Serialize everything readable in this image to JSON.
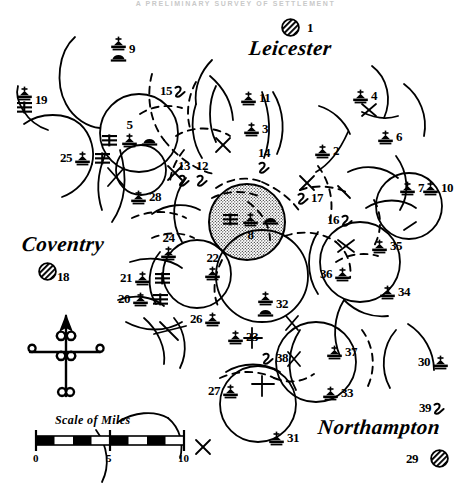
{
  "header": {
    "running_head": "A PRELIMINARY SURVEY OF SETTLEMENT"
  },
  "map": {
    "title": "Archaeological settlement distribution map",
    "scale_bar": {
      "caption": "Scale of Miles",
      "ticks": [
        "0",
        "5",
        "10"
      ],
      "units": "miles",
      "max": 10
    },
    "compass": {
      "name": "north-arrow",
      "direction": "N"
    },
    "legend_symbols": {
      "church": "church-symbol",
      "dome": "dome-symbol",
      "grid": "field-system-symbol",
      "hook": "moated-site-symbol",
      "town": "hatched-town-circle",
      "stipple": "stippled-territory"
    },
    "cities": [
      {
        "name": "Leicester",
        "number": "1",
        "x": 249,
        "y": 38,
        "marker_x": 281,
        "marker_y": 18,
        "num_x": 307,
        "num_y": 21
      },
      {
        "name": "Coventry",
        "number": "18",
        "x": 22,
        "y": 234,
        "marker_x": 38,
        "marker_y": 262,
        "num_x": 57,
        "num_y": 270
      },
      {
        "name": "Northampton",
        "number": "29",
        "x": 318,
        "y": 417,
        "marker_x": 430,
        "marker_y": 449,
        "num_x": 406,
        "num_y": 452
      }
    ],
    "sites": [
      {
        "id": "2",
        "number": "2",
        "symbols": [
          "church"
        ],
        "order": "sym-num",
        "x": 314,
        "y": 143
      },
      {
        "id": "3",
        "number": "3",
        "symbols": [
          "church"
        ],
        "order": "sym-num",
        "x": 243,
        "y": 121
      },
      {
        "id": "4",
        "number": "4",
        "symbols": [
          "church"
        ],
        "order": "sym-num",
        "x": 352,
        "y": 88
      },
      {
        "id": "5",
        "number": "5",
        "symbols": [
          "grid",
          "church",
          "dome"
        ],
        "order": "num-above",
        "x": 101,
        "y": 117
      },
      {
        "id": "6",
        "number": "6",
        "symbols": [
          "church"
        ],
        "order": "sym-num",
        "x": 377,
        "y": 129
      },
      {
        "id": "7",
        "number": "7",
        "symbols": [
          "church"
        ],
        "order": "sym-num",
        "x": 399,
        "y": 180
      },
      {
        "id": "8",
        "number": "8",
        "symbols": [
          "grid",
          "church",
          "dome"
        ],
        "order": "num-below",
        "x": 222,
        "y": 212
      },
      {
        "id": "9",
        "number": "9",
        "symbols": [
          "church",
          "dome"
        ],
        "order": "stack-num",
        "x": 110,
        "y": 36
      },
      {
        "id": "10",
        "number": "10",
        "symbols": [
          "church"
        ],
        "order": "sym-num",
        "x": 422,
        "y": 180
      },
      {
        "id": "11",
        "number": "11",
        "symbols": [
          "church"
        ],
        "order": "sym-num",
        "x": 240,
        "y": 90
      },
      {
        "id": "12",
        "number": "12",
        "symbols": [
          "hook"
        ],
        "order": "num-above",
        "x": 196,
        "y": 158
      },
      {
        "id": "13",
        "number": "13",
        "symbols": [
          "hook"
        ],
        "order": "num-above",
        "x": 178,
        "y": 158
      },
      {
        "id": "14",
        "number": "14",
        "symbols": [
          "hook"
        ],
        "order": "num-above",
        "x": 258,
        "y": 145
      },
      {
        "id": "15",
        "number": "15",
        "symbols": [
          "hook"
        ],
        "order": "num-sym",
        "x": 160,
        "y": 83
      },
      {
        "id": "16",
        "number": "16",
        "symbols": [
          "hook"
        ],
        "order": "num-sym",
        "x": 327,
        "y": 212
      },
      {
        "id": "17",
        "number": "17",
        "symbols": [
          "hook"
        ],
        "order": "sym-num",
        "x": 297,
        "y": 190
      },
      {
        "id": "19",
        "number": "19",
        "symbols": [
          "church",
          "grid"
        ],
        "order": "stack-num",
        "x": 16,
        "y": 86
      },
      {
        "id": "20",
        "number": "20",
        "symbols": [
          "church",
          "grid"
        ],
        "order": "num-sym",
        "x": 118,
        "y": 291
      },
      {
        "id": "21",
        "number": "21",
        "symbols": [
          "church",
          "grid"
        ],
        "order": "num-sym",
        "x": 120,
        "y": 270
      },
      {
        "id": "22",
        "number": "22",
        "symbols": [
          "church"
        ],
        "order": "num-above",
        "x": 204,
        "y": 250
      },
      {
        "id": "23",
        "number": "23",
        "symbols": [
          "church"
        ],
        "order": "sym-num",
        "x": 227,
        "y": 329
      },
      {
        "id": "24",
        "number": "24",
        "symbols": [
          "church"
        ],
        "order": "num-above",
        "x": 160,
        "y": 230
      },
      {
        "id": "25",
        "number": "25",
        "symbols": [
          "church",
          "grid"
        ],
        "order": "num-sym",
        "x": 60,
        "y": 150
      },
      {
        "id": "26",
        "number": "26",
        "symbols": [
          "church"
        ],
        "order": "num-sym",
        "x": 190,
        "y": 311
      },
      {
        "id": "27",
        "number": "27",
        "symbols": [
          "church"
        ],
        "order": "num-sym",
        "x": 208,
        "y": 383
      },
      {
        "id": "28",
        "number": "28",
        "symbols": [
          "church"
        ],
        "order": "sym-num",
        "x": 130,
        "y": 189
      },
      {
        "id": "30",
        "number": "30",
        "symbols": [
          "church"
        ],
        "order": "num-sym",
        "x": 418,
        "y": 354
      },
      {
        "id": "31",
        "number": "31",
        "symbols": [
          "church"
        ],
        "order": "sym-num",
        "x": 268,
        "y": 430
      },
      {
        "id": "32",
        "number": "32",
        "symbols": [
          "church",
          "dome"
        ],
        "order": "stack-num",
        "x": 257,
        "y": 291
      },
      {
        "id": "33",
        "number": "33",
        "symbols": [
          "church"
        ],
        "order": "sym-num",
        "x": 322,
        "y": 385
      },
      {
        "id": "34",
        "number": "34",
        "symbols": [
          "church"
        ],
        "order": "sym-num",
        "x": 379,
        "y": 284
      },
      {
        "id": "35",
        "number": "35",
        "symbols": [
          "church"
        ],
        "order": "sym-num",
        "x": 371,
        "y": 238
      },
      {
        "id": "36",
        "number": "36",
        "symbols": [
          "church"
        ],
        "order": "num-sym",
        "x": 320,
        "y": 266
      },
      {
        "id": "37",
        "number": "37",
        "symbols": [
          "church"
        ],
        "order": "sym-num",
        "x": 326,
        "y": 344
      },
      {
        "id": "38",
        "number": "38",
        "symbols": [
          "hook"
        ],
        "order": "sym-num",
        "x": 262,
        "y": 350
      },
      {
        "id": "39",
        "number": "39",
        "symbols": [
          "hook"
        ],
        "order": "num-sym",
        "x": 419,
        "y": 400
      }
    ]
  }
}
